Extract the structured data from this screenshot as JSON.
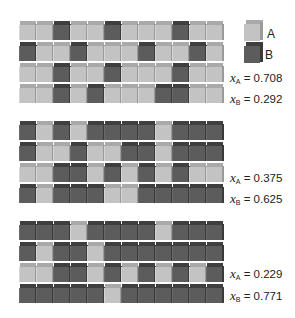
{
  "figure": {
    "legend": [
      {
        "species": "A",
        "label": "A",
        "color": "#c3c3c3"
      },
      {
        "species": "B",
        "label": "B",
        "color": "#5c5c5c"
      }
    ],
    "blocks": [
      {
        "rows": [
          "AABAABAAABAA",
          "BAABAAABAABA",
          "AABAABAAABAA",
          "AABABAAABBAA"
        ],
        "x_A_var": "x",
        "x_A_sub": "A",
        "x_A_value": "= 0.708",
        "x_B_var": "x",
        "x_B_sub": "B",
        "x_B_value": "= 0.292"
      },
      {
        "rows": [
          "BABABBBBABBB",
          "BAABAABBABBB",
          "AABBABABABAA",
          "BABBBAABBBBB"
        ],
        "x_A_var": "x",
        "x_A_sub": "A",
        "x_A_value": "= 0.375",
        "x_B_var": "x",
        "x_B_sub": "B",
        "x_B_value": "= 0.625"
      },
      {
        "rows": [
          "BBBABBBBABBB",
          "BABBABBBBBBB",
          "AABBABABABAB",
          "BBBBBABBBBBB"
        ],
        "x_A_var": "x",
        "x_A_sub": "A",
        "x_A_value": "= 0.229",
        "x_B_var": "x",
        "x_B_sub": "B",
        "x_B_value": "= 0.771"
      }
    ]
  }
}
